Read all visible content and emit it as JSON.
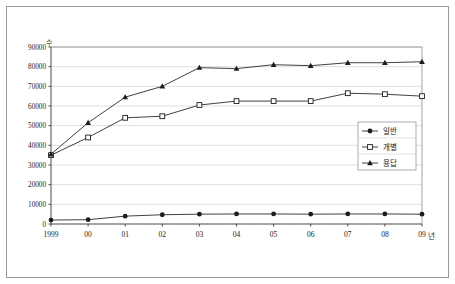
{
  "chart_data": {
    "type": "line",
    "title": "",
    "xlabel": "년",
    "ylabel": "수",
    "categories": [
      "1999",
      "00",
      "01",
      "02",
      "03",
      "04",
      "05",
      "06",
      "07",
      "08",
      "09"
    ],
    "ylim": [
      0,
      90000
    ],
    "ytick_labels": [
      "0",
      "10000",
      "20000",
      "30000",
      "40000",
      "50000",
      "60000",
      "70000",
      "80000",
      "90000"
    ],
    "ytick_values": [
      0,
      10000,
      20000,
      30000,
      40000,
      50000,
      60000,
      70000,
      80000,
      90000
    ],
    "grid": true,
    "legend_position": "right-middle",
    "series": [
      {
        "name": "일반",
        "marker": "circle",
        "values": [
          2000,
          2200,
          4000,
          4700,
          5000,
          5100,
          5100,
          5000,
          5100,
          5100,
          5000
        ]
      },
      {
        "name": "개별",
        "marker": "square",
        "values": [
          35000,
          44000,
          54000,
          54800,
          60500,
          62500,
          62500,
          62500,
          66500,
          66000,
          65000
        ]
      },
      {
        "name": "용답",
        "marker": "triangle",
        "values": [
          35500,
          51500,
          64500,
          70000,
          79500,
          79000,
          81000,
          80500,
          82000,
          82000,
          82500
        ]
      }
    ]
  },
  "axis": {
    "y_unit": "수",
    "x_unit": "년"
  },
  "legend": {
    "entries": [
      {
        "label": "일반",
        "marker": "circle-marker"
      },
      {
        "label": "개별",
        "marker": "square-marker"
      },
      {
        "label": "용답",
        "marker": "triangle-marker"
      }
    ]
  }
}
